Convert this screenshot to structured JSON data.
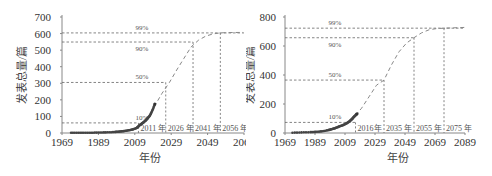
{
  "chart_data": [
    {
      "type": "line",
      "title": "",
      "xlabel": "年份",
      "ylabel": "发表总量/篇",
      "xlim": [
        1969,
        2069
      ],
      "ylim": [
        0,
        700
      ],
      "x_ticks": [
        "1969",
        "1989",
        "2009",
        "2029",
        "2049",
        "2069"
      ],
      "y_ticks": [
        "0",
        "100",
        "200",
        "300",
        "400",
        "500",
        "600",
        "700"
      ],
      "grid": false,
      "legend": null,
      "saturation": 610,
      "series": [
        {
          "name": "observed",
          "style": "markers",
          "x": [
            1974,
            1978,
            1982,
            1986,
            1990,
            1994,
            1998,
            2000,
            2002,
            2004,
            2006,
            2008,
            2010,
            2011,
            2012,
            2013,
            2014,
            2015,
            2016,
            2017,
            2018,
            2019,
            2020
          ],
          "values": [
            1,
            1,
            2,
            2,
            3,
            4,
            6,
            8,
            10,
            13,
            17,
            22,
            30,
            40,
            50,
            58,
            66,
            76,
            88,
            101,
            120,
            145,
            175
          ]
        },
        {
          "name": "logistic fit",
          "style": "dashed",
          "x": [
            2018,
            2020,
            2024,
            2028,
            2032,
            2036,
            2040,
            2044,
            2048,
            2052,
            2056,
            2060,
            2069
          ],
          "values": [
            120,
            165,
            240,
            305,
            380,
            450,
            520,
            560,
            585,
            598,
            604,
            606,
            607
          ]
        }
      ],
      "thresholds": [
        {
          "label": "10%",
          "value": 61,
          "year_label": "2011 年",
          "year": 2011
        },
        {
          "label": "50%",
          "value": 305,
          "year_label": "2026 年",
          "year": 2026
        },
        {
          "label": "90%",
          "value": 549,
          "year_label": "2041 年",
          "year": 2041
        },
        {
          "label": "99%",
          "value": 604,
          "year_label": "2056 年",
          "year": 2056
        }
      ]
    },
    {
      "type": "line",
      "title": "",
      "xlabel": "年份",
      "ylabel": "发表总量/篇",
      "xlim": [
        1969,
        2089
      ],
      "ylim": [
        0,
        800
      ],
      "x_ticks": [
        "1969",
        "1989",
        "2009",
        "2029",
        "2049",
        "2069",
        "2089"
      ],
      "y_ticks": [
        "0",
        "200",
        "400",
        "600",
        "800"
      ],
      "grid": false,
      "legend": null,
      "saturation": 730,
      "series": [
        {
          "name": "observed",
          "style": "markers",
          "x": [
            1974,
            1980,
            1986,
            1990,
            1994,
            1998,
            2000,
            2002,
            2004,
            2006,
            2008,
            2010,
            2012,
            2013,
            2014,
            2015,
            2016,
            2017
          ],
          "values": [
            2,
            4,
            6,
            8,
            12,
            20,
            26,
            32,
            40,
            48,
            56,
            66,
            80,
            90,
            100,
            112,
            122,
            132
          ]
        },
        {
          "name": "logistic fit",
          "style": "dashed",
          "x": [
            2016,
            2020,
            2025,
            2030,
            2035,
            2040,
            2045,
            2050,
            2055,
            2060,
            2065,
            2070,
            2075,
            2089
          ],
          "values": [
            122,
            170,
            250,
            330,
            365,
            470,
            560,
            620,
            657,
            690,
            712,
            720,
            723,
            728
          ]
        }
      ],
      "thresholds": [
        {
          "label": "10%",
          "value": 73,
          "year_label": "2016年",
          "year": 2016
        },
        {
          "label": "50%",
          "value": 365,
          "year_label": "2035 年",
          "year": 2035
        },
        {
          "label": "90%",
          "value": 657,
          "year_label": "2055 年",
          "year": 2055
        },
        {
          "label": "99%",
          "value": 723,
          "year_label": "2075 年",
          "year": 2075
        }
      ]
    }
  ]
}
